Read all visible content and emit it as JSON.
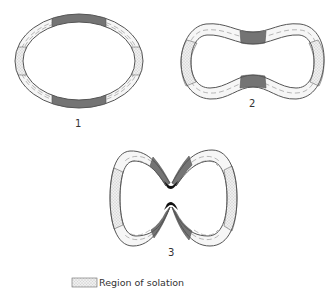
{
  "figure": {
    "stages": [
      {
        "id": 1,
        "label": "1",
        "shape": "ellipse"
      },
      {
        "id": 2,
        "label": "2",
        "shape": "dumbbell"
      },
      {
        "id": 3,
        "label": "3",
        "shape": "pinched-double-lobe"
      }
    ],
    "legend": {
      "items": [
        {
          "swatch": "dotted",
          "label": "Region of solation"
        }
      ]
    },
    "colors": {
      "outline": "#555555",
      "contracting_band": "#7a7a7a",
      "solation_fill": "#e4e4e4",
      "pinch_tip": "#111111",
      "background": "#ffffff"
    }
  }
}
